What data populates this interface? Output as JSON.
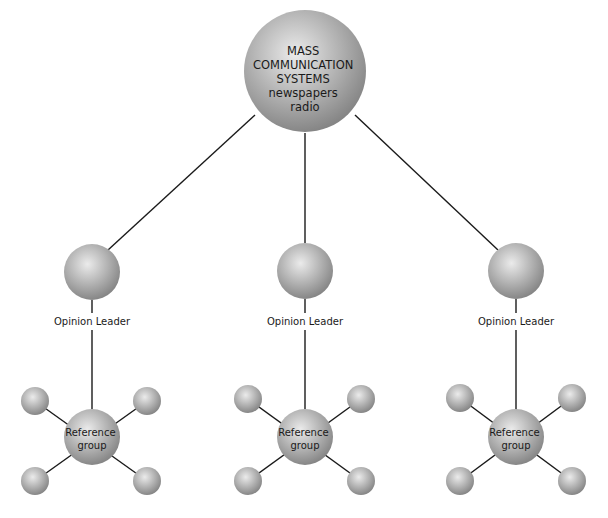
{
  "diagram": {
    "type": "two-step-flow",
    "top_node": {
      "lines": [
        "MASS",
        "COMMUNICATION",
        "SYSTEMS",
        "newspapers",
        "radio"
      ]
    },
    "opinion_leaders": [
      {
        "label": "Opinion Leader"
      },
      {
        "label": "Opinion Leader"
      },
      {
        "label": "Opinion Leader"
      }
    ],
    "reference_groups": [
      {
        "lines": [
          "Reference",
          "group"
        ]
      },
      {
        "lines": [
          "Reference",
          "group"
        ]
      },
      {
        "lines": [
          "Reference",
          "group"
        ]
      }
    ],
    "colors": {
      "sphere_light": "#e8e8e8",
      "sphere_mid": "#b4b4b4",
      "sphere_dark": "#8a8a8a",
      "line": "#1a1a1a"
    }
  }
}
